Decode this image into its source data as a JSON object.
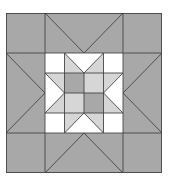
{
  "diagram": {
    "type": "quilt-block",
    "grid": "4x4 outer grid with nested 4x4 center star",
    "colors": {
      "dark": "#a8a8a8",
      "light": "#d6d6d6",
      "white": "#ffffff",
      "line": "#444444"
    }
  }
}
